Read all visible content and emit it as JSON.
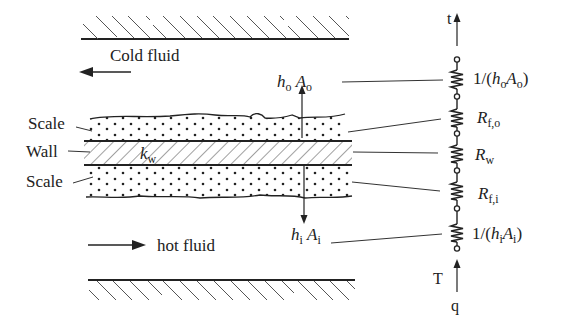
{
  "diagram": {
    "type": "heat-exchanger-wall-thermal-resistance",
    "left_labels": {
      "scale_top": "Scale",
      "wall": "Wall",
      "scale_bottom": "Scale"
    },
    "fluids": {
      "cold": {
        "label": "Cold fluid",
        "direction": "left"
      },
      "hot": {
        "label": "hot fluid",
        "direction": "right"
      }
    },
    "wall_conductivity": {
      "symbol": "k",
      "sub": "w"
    },
    "outer_coefficient": {
      "h": "h",
      "h_sub": "o",
      "A": "A",
      "A_sub": "o"
    },
    "inner_coefficient": {
      "h": "h",
      "h_sub": "i",
      "A": "A",
      "A_sub": "i"
    },
    "circuit": {
      "top_label": "t",
      "bottom_label_T": "T",
      "bottom_label_q": "q",
      "resistors": [
        {
          "prefix": "1/(",
          "h": "h",
          "h_sub": "o",
          "A": "A",
          "A_sub": "o",
          "suffix": ")"
        },
        {
          "R": "R",
          "sub": "f,o"
        },
        {
          "R": "R",
          "sub": "w"
        },
        {
          "R": "R",
          "sub": "f,i"
        },
        {
          "prefix": "1/(",
          "h": "h",
          "h_sub": "i",
          "A": "A",
          "A_sub": "i",
          "suffix": ")"
        }
      ]
    },
    "colors": {
      "line": "#222222",
      "hatch": "#555555",
      "background": "#ffffff"
    }
  }
}
